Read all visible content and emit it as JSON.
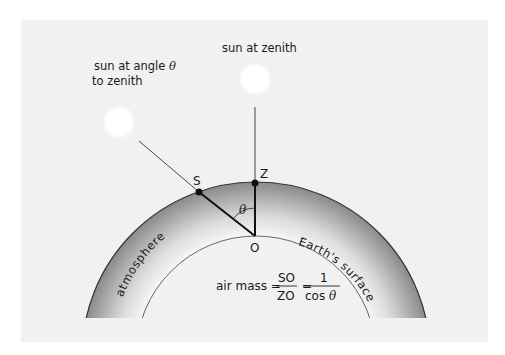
{
  "diagram": {
    "labels": {
      "sun_angle_line1": "sun at angle",
      "sun_angle_theta": "θ",
      "sun_angle_line2": "to zenith",
      "sun_zenith": "sun at zenith",
      "point_s": "S",
      "point_z": "Z",
      "point_o": "O",
      "angle": "θ",
      "atmosphere": "atmosphere",
      "earth_surface": "Earth's surface"
    },
    "formula": {
      "prefix": "air mass =",
      "num1": "SO",
      "den1": "ZO",
      "equals": "=",
      "num2": "1",
      "den2_text": "cos",
      "den2_theta": "θ"
    },
    "colors": {
      "background": "#f1f1f1",
      "atmosphere_dark": "#8c8c8c",
      "atmosphere_light": "#f4f4f4",
      "sun": "#ffffff",
      "line": "#1a1a1a"
    }
  }
}
